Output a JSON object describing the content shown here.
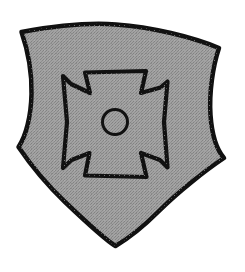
{
  "image": {
    "kind": "heraldic-illustration",
    "subject": "shield-with-cross-pattee",
    "caption": "Shield charged with a cross pattee voided by a roundel",
    "background_color": "#ffffff",
    "canvas": {
      "width": 245,
      "height": 272
    }
  },
  "shield": {
    "name": "escutcheon",
    "fill_color": "#9d9d9d",
    "fill_texture": "halftone-speckle",
    "texture_dot_color": "#7c7c7c",
    "outline_color": "#111111",
    "outline_width": 4.5,
    "outline_style": "hand-drawn",
    "top_left_corner": "21,32",
    "top_apex": "115,24",
    "top_right_corner": "219,48",
    "left_inflection": "18,147",
    "right_inflection": "224,158",
    "bottom_point": "115,246",
    "path": "M 21.5 32 C 60 25 92 22.5 116 24.5 C 152 27 192 37 219 48 C 213 66 209 92 210.5 115 C 212 136 217 150 224 158 C 206 170 178 192 158 212 C 138 232 124 241 115.5 246 C 104 239 86 222 65 202 C 44 182 28 161 18.5 147 C 26 136 31 116 31.5 94 C 32 72 27 48 21.5 32 Z"
  },
  "charge": {
    "name": "cross-pattee",
    "fill_color": "#9d9d9d",
    "outline_color": "#111111",
    "outline_width": 4.2,
    "center": "115,122",
    "span_x": "62,168",
    "span_y": "72,178",
    "arm_notch_style": "concave-chevron",
    "path": "M 85 72.5 L 146 71 L 141 93 L 160.5 87.5 L 167.5 81.5 L 164 122 L 167.5 167.5 L 160 160 L 141 153 L 146.5 177 L 85 175.5 L 89.5 153 L 71.5 160 L 63 168 L 67 122 L 63 76 L 71 84 L 90 93 Z"
  },
  "roundel": {
    "name": "annulet",
    "center_x": 115,
    "center_y": 122,
    "radius": 12.5,
    "fill_color": "#9d9d9d",
    "outline_color": "#111111",
    "outline_width": 3
  }
}
